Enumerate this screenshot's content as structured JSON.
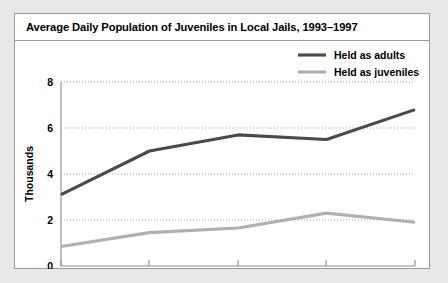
{
  "card": {
    "title": "Average Daily Population of Juveniles in Local Jails, 1993–1997"
  },
  "chart_data": {
    "type": "line",
    "title": "Average Daily Population of Juveniles in Local Jails, 1993–1997",
    "xlabel": "",
    "ylabel": "Thousands",
    "categories": [
      "1993",
      "1994",
      "1995",
      "1996",
      "1997"
    ],
    "x": [
      1993,
      1994,
      1995,
      1996,
      1997
    ],
    "series": [
      {
        "name": "Held as adults",
        "color": "#4a4a4a",
        "values": [
          3.1,
          5.0,
          5.7,
          5.5,
          6.8
        ]
      },
      {
        "name": "Held as juveniles",
        "color": "#b0b0b0",
        "values": [
          0.85,
          1.45,
          1.65,
          2.3,
          1.9
        ]
      }
    ],
    "ylim": [
      0,
      8
    ],
    "yticks": [
      0,
      2,
      4,
      6,
      8
    ],
    "ytick_labels": [
      "0",
      "2",
      "4",
      "6",
      "8"
    ],
    "xtick_labels": [
      "1993",
      "1994",
      "1995",
      "1996",
      "1997"
    ],
    "grid": true,
    "grid_axis": "y",
    "grid_style": "dotted",
    "legend_position": "top-right"
  },
  "legend": {
    "items": [
      {
        "label": "Held as adults",
        "color": "#4a4a4a"
      },
      {
        "label": "Held as juveniles",
        "color": "#b0b0b0"
      }
    ]
  },
  "axes": {
    "y_title": "Thousands",
    "y_ticks": [
      "8",
      "6",
      "4",
      "2",
      "0"
    ],
    "x_ticks": [
      "1993",
      "1994",
      "1995",
      "1996",
      "1997"
    ]
  },
  "colors": {
    "page_background": "#e8e8e8",
    "card_background": "#ffffff",
    "card_border": "#9a9a9a",
    "series_adults": "#4a4a4a",
    "series_juveniles": "#b0b0b0",
    "gridline": "#9a9a9a",
    "axis": "#8c8c8c",
    "text": "#000000"
  }
}
